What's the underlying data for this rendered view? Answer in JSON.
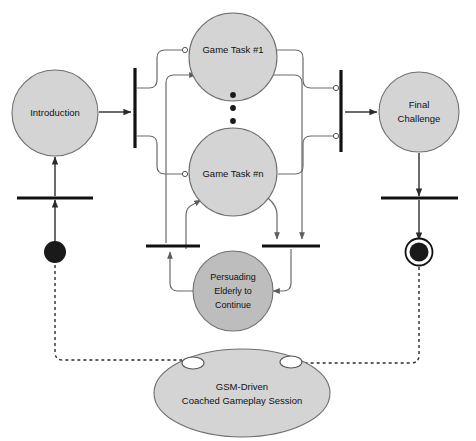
{
  "diagram": {
    "type": "uml-activity-diagram",
    "title": "GSM-Driven Coached Gameplay Session",
    "background_color": "#ffffff",
    "palette": {
      "activity_fill": "#d4d4d4",
      "activity_stroke": "#6f6f6f",
      "emphasis_fill": "#bdbdbd",
      "ellipse_fill": "#d4d4d4",
      "line_color": "#2b2b2b",
      "bar_color": "#111111",
      "node_fill": "#1a1a1a",
      "connector_fill": "#ffffff"
    },
    "nodes": [
      {
        "id": "start",
        "kind": "initial-node",
        "label": ""
      },
      {
        "id": "introduction",
        "kind": "activity",
        "label": "Introduction"
      },
      {
        "id": "fork_left",
        "kind": "fork-bar",
        "label": ""
      },
      {
        "id": "game_task_1",
        "kind": "activity",
        "label": "Game Task #1"
      },
      {
        "id": "ellipsis",
        "kind": "ellipsis",
        "label": ""
      },
      {
        "id": "game_task_n",
        "kind": "activity",
        "label": "Game Task #n"
      },
      {
        "id": "join_right",
        "kind": "join-bar",
        "label": ""
      },
      {
        "id": "final_challenge",
        "kind": "activity",
        "label_line1": "Final",
        "label_line2": "Challenge"
      },
      {
        "id": "persuading",
        "kind": "activity-emphasis",
        "label_line1": "Persuading",
        "label_line2": "Elderly to",
        "label_line3": "Continue"
      },
      {
        "id": "bar_mid_left",
        "kind": "join-bar",
        "label": ""
      },
      {
        "id": "bar_mid_right",
        "kind": "join-bar",
        "label": ""
      },
      {
        "id": "bar_intro_in",
        "kind": "bar",
        "label": ""
      },
      {
        "id": "bar_final_out",
        "kind": "bar",
        "label": ""
      },
      {
        "id": "final_node",
        "kind": "final-node",
        "label": ""
      },
      {
        "id": "gsm_session",
        "kind": "session-ellipse",
        "label_line1": "GSM-Driven",
        "label_line2": "Coached Gameplay Session"
      }
    ],
    "labels": {
      "introduction": "Introduction",
      "game_task_1": "Game Task #1",
      "game_task_n": "Game Task #n",
      "final_challenge_line1": "Final",
      "final_challenge_line2": "Challenge",
      "persuading_line1": "Persuading",
      "persuading_line2": "Elderly to",
      "persuading_line3": "Continue",
      "session_line1": "GSM-Driven",
      "session_line2": "Coached Gameplay Session"
    },
    "icons": {
      "initial_node": "filled-circle-icon",
      "final_node": "bullseye-circle-icon",
      "fork_bar": "vertical-bar-icon",
      "join_bar": "horizontal-bar-icon",
      "ellipsis": "vertical-ellipsis-icon",
      "connector": "hollow-circle-connector-icon",
      "session_port_left": "hollow-ellipse-port-icon",
      "session_port_right": "hollow-ellipse-port-icon"
    }
  }
}
